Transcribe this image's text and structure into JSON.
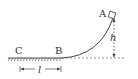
{
  "diagram": {
    "type": "physics-track",
    "labels": {
      "A": "A",
      "B": "B",
      "C": "C",
      "height": "h",
      "length": "l"
    },
    "colors": {
      "line": "#444444",
      "background": "#ffffff"
    }
  }
}
